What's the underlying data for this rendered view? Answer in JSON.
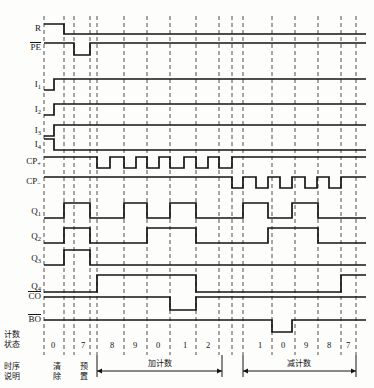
{
  "figure": {
    "type": "digital-timing-diagram",
    "title": "",
    "background": "#fdfdfc",
    "line_color": "#141414",
    "dash_color": "#3a3a3a"
  },
  "signals": [
    {
      "name": "R",
      "label": "R",
      "overline": false,
      "sub": "",
      "y": 29
    },
    {
      "name": "PE",
      "label": "PE",
      "overline": true,
      "sub": "",
      "y": 48
    },
    {
      "name": "I1",
      "label": "I",
      "overline": false,
      "sub": "1",
      "y": 85
    },
    {
      "name": "I2",
      "label": "I",
      "overline": false,
      "sub": "2",
      "y": 110
    },
    {
      "name": "I3",
      "label": "I",
      "overline": false,
      "sub": "3",
      "y": 131
    },
    {
      "name": "I4",
      "label": "I",
      "overline": false,
      "sub": "4",
      "y": 145
    },
    {
      "name": "CPup",
      "label": "CP",
      "overline": false,
      "sub": "+",
      "y": 162
    },
    {
      "name": "CPdn",
      "label": "CP",
      "overline": false,
      "sub": "−",
      "y": 182
    },
    {
      "name": "Q1",
      "label": "Q",
      "overline": false,
      "sub": "1",
      "y": 212
    },
    {
      "name": "Q2",
      "label": "Q",
      "overline": false,
      "sub": "2",
      "y": 237
    },
    {
      "name": "Q3",
      "label": "Q",
      "overline": false,
      "sub": "3",
      "y": 259
    },
    {
      "name": "Q4",
      "label": "Q",
      "overline": false,
      "sub": "4",
      "y": 287
    },
    {
      "name": "CO",
      "label": "CO",
      "overline": true,
      "sub": "",
      "y": 297
    },
    {
      "name": "BO",
      "label": "BO",
      "overline": true,
      "sub": "",
      "y": 320
    }
  ],
  "count_states": [
    {
      "value": "0",
      "x": 53
    },
    {
      "value": "7",
      "x": 83
    },
    {
      "value": "8",
      "x": 112
    },
    {
      "value": "9",
      "x": 135
    },
    {
      "value": "0",
      "x": 158
    },
    {
      "value": "1",
      "x": 185
    },
    {
      "value": "2",
      "x": 208
    },
    {
      "value": "1",
      "x": 260
    },
    {
      "value": "0",
      "x": 283
    },
    {
      "value": "9",
      "x": 306
    },
    {
      "value": "8",
      "x": 329
    },
    {
      "value": "7",
      "x": 348
    }
  ],
  "row_labels": {
    "count_state": "计数\n状态",
    "count_state_line1": "计数",
    "count_state_line2": "状态",
    "timing_note_line1": "时序",
    "timing_note_line2": "说明"
  },
  "phase_labels": [
    {
      "name": "clear",
      "line1": "清",
      "line2": "除",
      "x": 58
    },
    {
      "name": "preset",
      "line1": "预",
      "line2": "置",
      "x": 85
    }
  ],
  "sections": [
    {
      "name": "up-count",
      "label": "加计数",
      "x_start": 97,
      "x_end": 222,
      "label_x": 160
    },
    {
      "name": "down-count",
      "label": "减计数",
      "x_start": 243,
      "x_end": 356,
      "label_x": 299
    }
  ],
  "axis": {
    "plot_left": 44,
    "plot_right": 366,
    "gridlines": [
      44,
      64,
      74,
      90,
      97,
      124,
      147,
      170,
      196,
      219,
      232,
      243,
      272,
      295,
      318,
      341,
      356
    ]
  },
  "waveforms": {
    "R": "M44,24 L64,24 L64,34 L366,34",
    "PE": "M44,43 L74,43 L74,55 L90,55 L90,43 L366,43",
    "I1": "M44,90 L54,90 L54,79 L366,79",
    "I2": "M44,115 L54,115 L54,104 L366,104",
    "I3": "M44,136 L54,136 L54,125 L366,125",
    "I4": "M44,139 L54,139 L54,150 L366,150",
    "CPup": "M44,157 L97,157 L97,168 L110,168 L110,157 L124,157 L124,168 L136,168 L136,157 L147,157 L147,168 L159,168 L159,157 L170,157 L170,168 L184,168 L184,157 L196,157 L196,168 L208,168 L208,157 L219,157 L219,168 L232,168 L232,157 L366,157",
    "CPdn": "M44,177 L232,177 L232,188 L243,188 L243,177 L256,177 L256,188 L268,188 L268,177 L280,177 L280,188 L292,188 L292,177 L305,177 L305,188 L317,188 L317,177 L329,177 L329,188 L341,188 L341,177 L366,177",
    "Q1": "M44,218 L64,218 L64,203 L90,203 L90,218 L124,218 L124,203 L147,203 L147,218 L170,218 L170,203 L196,203 L196,218 L243,218 L243,203 L268,203 L268,218 L292,218 L292,203 L318,203 L318,218 L366,218",
    "Q2": "M44,243 L64,243 L64,228 L90,228 L90,243 L147,243 L147,228 L196,228 L196,243 L268,243 L268,228 L318,228 L318,243 L366,243",
    "Q3": "M44,265 L64,265 L64,250 L90,250 L90,265 L366,265",
    "Q4": "M44,292 L97,292 L97,275 L196,275 L196,292 L341,292 L341,275 L366,275",
    "CO": "M44,297 L170,297 L170,310 L196,310 L196,297 L366,297",
    "BO": "M44,320 L272,320 L272,332 L292,332 L292,320 L366,320"
  }
}
